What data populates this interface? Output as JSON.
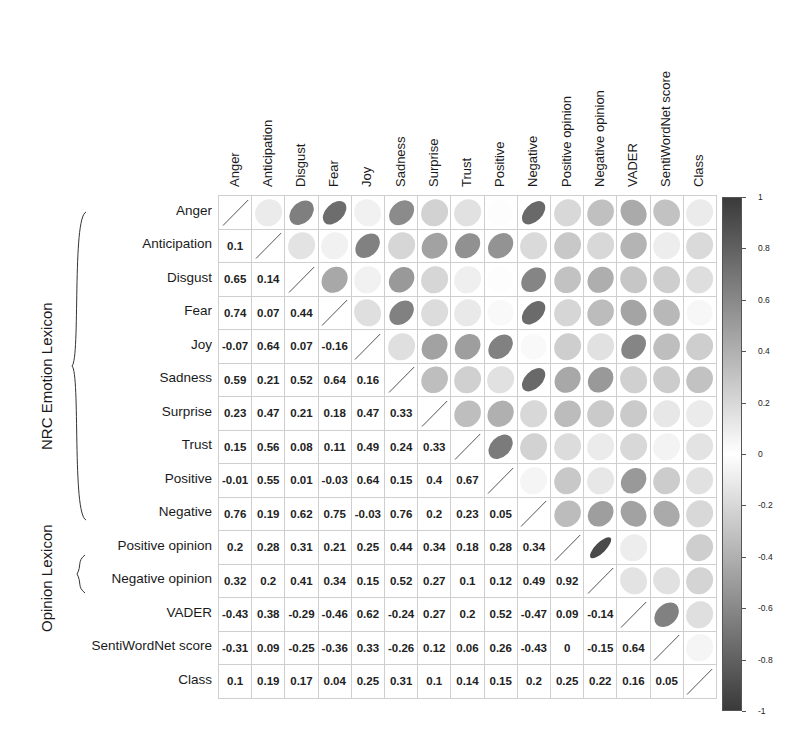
{
  "chart_data": {
    "type": "heatmap",
    "subtype": "correlation-matrix",
    "title": "",
    "variables": [
      "Anger",
      "Anticipation",
      "Disgust",
      "Fear",
      "Joy",
      "Sadness",
      "Surprise",
      "Trust",
      "Positive",
      "Negative",
      "Positive opinion",
      "Negative opinion",
      "VADER",
      "SentiWordNet score",
      "Class"
    ],
    "groups": [
      {
        "label": "NRC Emotion Lexicon",
        "members": [
          "Anger",
          "Anticipation",
          "Disgust",
          "Fear",
          "Joy",
          "Sadness",
          "Surprise",
          "Trust",
          "Positive",
          "Negative"
        ]
      },
      {
        "label": "Opinion Lexicon",
        "members": [
          "Positive opinion",
          "Negative opinion"
        ]
      }
    ],
    "lower_triangle": [
      [],
      [
        0.1
      ],
      [
        0.65,
        0.14
      ],
      [
        0.74,
        0.07,
        0.44
      ],
      [
        -0.07,
        0.64,
        0.07,
        -0.16
      ],
      [
        0.59,
        0.21,
        0.52,
        0.64,
        0.16
      ],
      [
        0.23,
        0.47,
        0.21,
        0.18,
        0.47,
        0.33
      ],
      [
        0.15,
        0.56,
        0.08,
        0.11,
        0.49,
        0.24,
        0.33
      ],
      [
        -0.01,
        0.55,
        0.01,
        -0.03,
        0.64,
        0.15,
        0.4,
        0.67
      ],
      [
        0.76,
        0.19,
        0.62,
        0.75,
        -0.03,
        0.76,
        0.2,
        0.23,
        0.05
      ],
      [
        0.2,
        0.28,
        0.31,
        0.21,
        0.25,
        0.44,
        0.34,
        0.18,
        0.28,
        0.34
      ],
      [
        0.32,
        0.2,
        0.41,
        0.34,
        0.15,
        0.52,
        0.27,
        0.1,
        0.12,
        0.49,
        0.92
      ],
      [
        -0.43,
        0.38,
        -0.29,
        -0.46,
        0.62,
        -0.24,
        0.27,
        0.2,
        0.52,
        -0.47,
        0.09,
        -0.14
      ],
      [
        -0.31,
        0.09,
        -0.25,
        -0.36,
        0.33,
        -0.26,
        0.12,
        0.06,
        0.26,
        -0.43,
        0,
        -0.15,
        0.64
      ],
      [
        0.1,
        0.19,
        0.17,
        0.04,
        0.25,
        0.31,
        0.1,
        0.14,
        0.15,
        0.2,
        0.25,
        0.22,
        0.16,
        0.05
      ]
    ],
    "upper_triangle_style": "ellipse",
    "lower_triangle_style": "number",
    "diagonal_style": "slash",
    "colorbar": {
      "range": [
        -1,
        1
      ],
      "ticks": [
        "1",
        "0.8",
        "0.6",
        "0.4",
        "0.2",
        "0",
        "-0.2",
        "-0.4",
        "-0.6",
        "-0.8",
        "-1"
      ],
      "colors": {
        "high": "#3a3a3a",
        "mid": "#ffffff",
        "low": "#3a3a3a"
      }
    },
    "grid": true,
    "legend_position": "right"
  }
}
